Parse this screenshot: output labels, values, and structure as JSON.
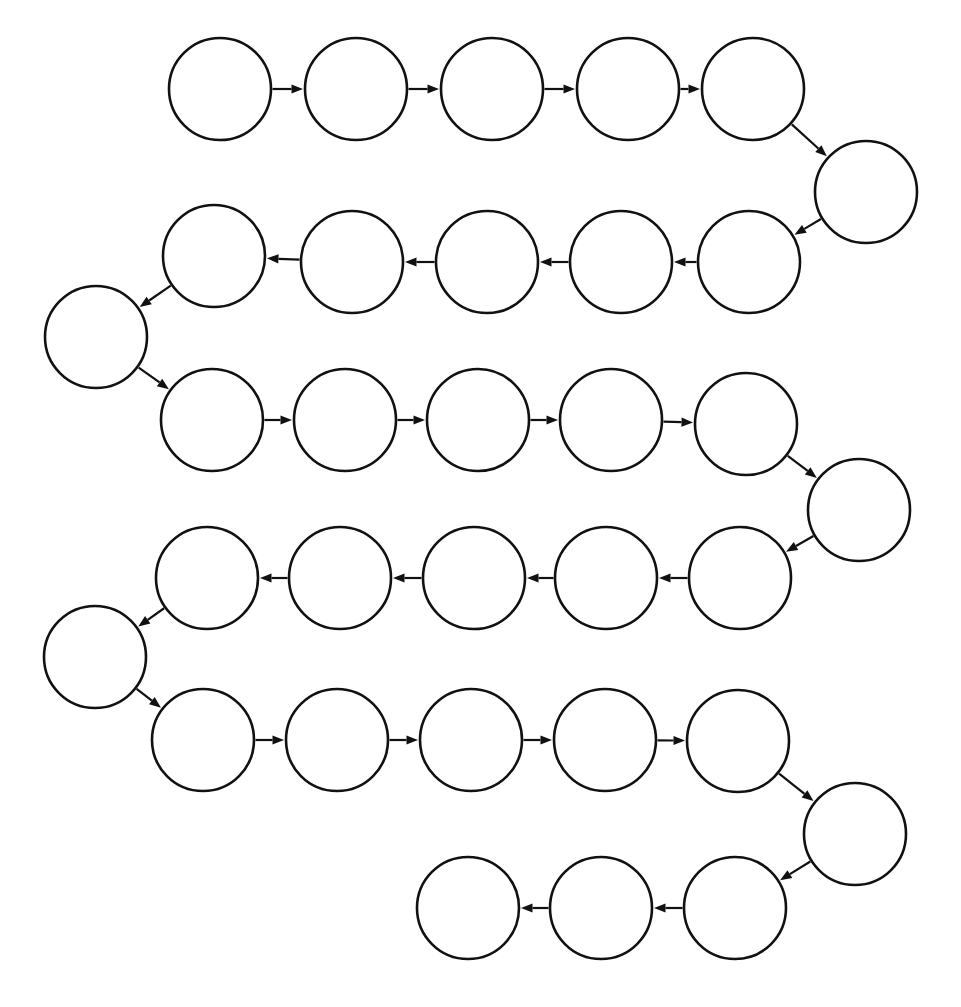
{
  "diagram": {
    "type": "directed-graph",
    "node_shape": "circle",
    "node_fill": "#ffffff",
    "node_stroke": "#111111",
    "edge_color": "#111111",
    "background": "#ffffff",
    "node_count": 28,
    "edge_count": 27,
    "node_radius": 51,
    "node_label_text": "",
    "rows": [
      {
        "index": 1,
        "direction": "left-to-right",
        "count": 5
      },
      {
        "index": 2,
        "direction": "turn",
        "count": 1
      },
      {
        "index": 3,
        "direction": "right-to-left",
        "count": 5
      },
      {
        "index": 4,
        "direction": "turn",
        "count": 1
      },
      {
        "index": 5,
        "direction": "left-to-right",
        "count": 5
      },
      {
        "index": 6,
        "direction": "turn",
        "count": 1
      },
      {
        "index": 7,
        "direction": "right-to-left",
        "count": 5
      },
      {
        "index": 8,
        "direction": "turn",
        "count": 1
      },
      {
        "index": 9,
        "direction": "left-to-right",
        "count": 5
      },
      {
        "index": 10,
        "direction": "turn",
        "count": 1
      },
      {
        "index": 11,
        "direction": "right-to-left",
        "count": 3
      }
    ],
    "nodes": [
      {
        "id": "n1",
        "cx": 220,
        "cy": 89,
        "r": 51,
        "label": ""
      },
      {
        "id": "n2",
        "cx": 356,
        "cy": 89,
        "r": 51,
        "label": ""
      },
      {
        "id": "n3",
        "cx": 492,
        "cy": 89,
        "r": 51,
        "label": ""
      },
      {
        "id": "n4",
        "cx": 628,
        "cy": 89,
        "r": 51,
        "label": ""
      },
      {
        "id": "n5",
        "cx": 753,
        "cy": 89,
        "r": 51,
        "label": ""
      },
      {
        "id": "n6",
        "cx": 866,
        "cy": 192,
        "r": 51,
        "label": ""
      },
      {
        "id": "n7",
        "cx": 749,
        "cy": 262,
        "r": 51,
        "label": ""
      },
      {
        "id": "n8",
        "cx": 621,
        "cy": 262,
        "r": 51,
        "label": ""
      },
      {
        "id": "n9",
        "cx": 487,
        "cy": 262,
        "r": 51,
        "label": ""
      },
      {
        "id": "n10",
        "cx": 352,
        "cy": 262,
        "r": 51,
        "label": ""
      },
      {
        "id": "n11",
        "cx": 214,
        "cy": 256,
        "r": 51,
        "label": ""
      },
      {
        "id": "n12",
        "cx": 96,
        "cy": 337,
        "r": 51,
        "label": ""
      },
      {
        "id": "n13",
        "cx": 212,
        "cy": 420,
        "r": 51,
        "label": ""
      },
      {
        "id": "n14",
        "cx": 345,
        "cy": 420,
        "r": 51,
        "label": ""
      },
      {
        "id": "n15",
        "cx": 478,
        "cy": 420,
        "r": 51,
        "label": ""
      },
      {
        "id": "n16",
        "cx": 611,
        "cy": 420,
        "r": 51,
        "label": ""
      },
      {
        "id": "n17",
        "cx": 746,
        "cy": 424,
        "r": 51,
        "label": ""
      },
      {
        "id": "n18",
        "cx": 859,
        "cy": 510,
        "r": 51,
        "label": ""
      },
      {
        "id": "n19",
        "cx": 740,
        "cy": 578,
        "r": 51,
        "label": ""
      },
      {
        "id": "n20",
        "cx": 606,
        "cy": 578,
        "r": 51,
        "label": ""
      },
      {
        "id": "n21",
        "cx": 474,
        "cy": 578,
        "r": 51,
        "label": ""
      },
      {
        "id": "n22",
        "cx": 340,
        "cy": 578,
        "r": 51,
        "label": ""
      },
      {
        "id": "n23",
        "cx": 207,
        "cy": 578,
        "r": 51,
        "label": ""
      },
      {
        "id": "n24",
        "cx": 95,
        "cy": 657,
        "r": 51,
        "label": ""
      },
      {
        "id": "n25",
        "cx": 203,
        "cy": 740,
        "r": 51,
        "label": ""
      },
      {
        "id": "n26",
        "cx": 337,
        "cy": 740,
        "r": 51,
        "label": ""
      },
      {
        "id": "n27",
        "cx": 471,
        "cy": 740,
        "r": 51,
        "label": ""
      },
      {
        "id": "n28",
        "cx": 605,
        "cy": 740,
        "r": 51,
        "label": ""
      },
      {
        "id": "n29",
        "cx": 738,
        "cy": 741,
        "r": 51,
        "label": ""
      },
      {
        "id": "n30",
        "cx": 855,
        "cy": 834,
        "r": 51,
        "label": ""
      },
      {
        "id": "n31",
        "cx": 735,
        "cy": 908,
        "r": 51,
        "label": ""
      },
      {
        "id": "n32",
        "cx": 601,
        "cy": 908,
        "r": 51,
        "label": ""
      },
      {
        "id": "n33",
        "cx": 468,
        "cy": 908,
        "r": 51,
        "label": ""
      }
    ],
    "edges": [
      {
        "from": "n1",
        "to": "n2",
        "kind": "horizontal-right"
      },
      {
        "from": "n2",
        "to": "n3",
        "kind": "horizontal-right"
      },
      {
        "from": "n3",
        "to": "n4",
        "kind": "horizontal-right"
      },
      {
        "from": "n4",
        "to": "n5",
        "kind": "horizontal-right"
      },
      {
        "from": "n5",
        "to": "n6",
        "kind": "diagonal-down-right"
      },
      {
        "from": "n6",
        "to": "n7",
        "kind": "diagonal-down-left"
      },
      {
        "from": "n7",
        "to": "n8",
        "kind": "horizontal-left"
      },
      {
        "from": "n8",
        "to": "n9",
        "kind": "horizontal-left"
      },
      {
        "from": "n9",
        "to": "n10",
        "kind": "horizontal-left"
      },
      {
        "from": "n10",
        "to": "n11",
        "kind": "horizontal-left"
      },
      {
        "from": "n11",
        "to": "n12",
        "kind": "diagonal-down-left"
      },
      {
        "from": "n12",
        "to": "n13",
        "kind": "diagonal-down-right"
      },
      {
        "from": "n13",
        "to": "n14",
        "kind": "horizontal-right"
      },
      {
        "from": "n14",
        "to": "n15",
        "kind": "horizontal-right"
      },
      {
        "from": "n15",
        "to": "n16",
        "kind": "horizontal-right"
      },
      {
        "from": "n16",
        "to": "n17",
        "kind": "horizontal-right"
      },
      {
        "from": "n17",
        "to": "n18",
        "kind": "diagonal-down-right"
      },
      {
        "from": "n18",
        "to": "n19",
        "kind": "diagonal-down-left"
      },
      {
        "from": "n19",
        "to": "n20",
        "kind": "horizontal-left"
      },
      {
        "from": "n20",
        "to": "n21",
        "kind": "horizontal-left"
      },
      {
        "from": "n21",
        "to": "n22",
        "kind": "horizontal-left"
      },
      {
        "from": "n22",
        "to": "n23",
        "kind": "horizontal-left"
      },
      {
        "from": "n23",
        "to": "n24",
        "kind": "diagonal-down-left"
      },
      {
        "from": "n24",
        "to": "n25",
        "kind": "diagonal-down-right"
      },
      {
        "from": "n25",
        "to": "n26",
        "kind": "horizontal-right"
      },
      {
        "from": "n26",
        "to": "n27",
        "kind": "horizontal-right"
      },
      {
        "from": "n27",
        "to": "n28",
        "kind": "horizontal-right"
      },
      {
        "from": "n28",
        "to": "n29",
        "kind": "horizontal-right"
      },
      {
        "from": "n29",
        "to": "n30",
        "kind": "diagonal-down-right"
      },
      {
        "from": "n30",
        "to": "n31",
        "kind": "diagonal-down-left"
      },
      {
        "from": "n31",
        "to": "n32",
        "kind": "horizontal-left"
      },
      {
        "from": "n32",
        "to": "n33",
        "kind": "horizontal-left"
      }
    ]
  }
}
